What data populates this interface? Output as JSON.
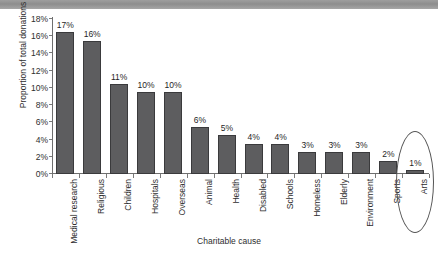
{
  "chart_data": {
    "type": "bar",
    "title": "",
    "xlabel": "Charitable cause",
    "ylabel": "Proportion of total donations",
    "categories": [
      "Medical research",
      "Religious",
      "Children",
      "Hospitals",
      "Overseas",
      "Animal",
      "Health",
      "Disabled",
      "Schools",
      "Homeless",
      "Elderly",
      "Environment",
      "Sports",
      "Arts"
    ],
    "values": [
      17,
      16,
      11,
      10,
      10,
      6,
      5,
      4,
      4,
      3,
      3,
      3,
      2,
      1
    ],
    "value_labels": [
      "17%",
      "16%",
      "11%",
      "10%",
      "10%",
      "6%",
      "5%",
      "4%",
      "4%",
      "3%",
      "3%",
      "3%",
      "2%",
      "1%"
    ],
    "ylim": [
      0,
      18
    ],
    "ytick_labels": [
      "0%",
      "2%",
      "4%",
      "6%",
      "8%",
      "10%",
      "12%",
      "14%",
      "16%",
      "18%"
    ],
    "ytick_values": [
      0,
      2,
      4,
      6,
      8,
      10,
      12,
      14,
      16,
      18
    ],
    "grid": false,
    "legend": "none",
    "bar_color": "#5d5d5f",
    "bar_border_color": "#3a3a3c",
    "axis_color": "#6f6f6f",
    "text_color": "#2e2e2e",
    "annotations": [
      {
        "type": "ellipse",
        "label": "Arts highlight",
        "target_category": "Arts"
      }
    ]
  }
}
